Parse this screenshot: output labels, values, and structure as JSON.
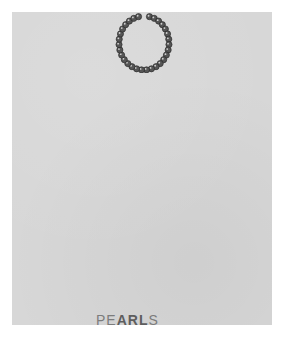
{
  "image": {
    "subject": "pearl necklace on plain gray background",
    "background_color": "#ffffff",
    "panel_color": "#d7d7d7",
    "pearl_color": "#555555"
  },
  "caption": {
    "prefix": "PE",
    "obscured": "ARL",
    "suffix": "S"
  },
  "necklace": {
    "icon": "pearl-necklace-icon",
    "bead_count": 30
  }
}
